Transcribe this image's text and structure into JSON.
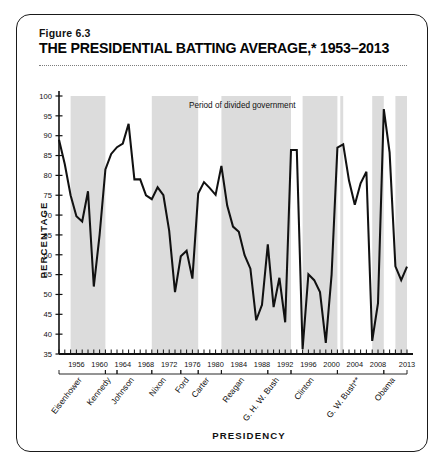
{
  "figure": {
    "label": "Figure 6.3",
    "title": "THE PRESIDENTIAL BATTING AVERAGE,* 1953–2013"
  },
  "legend": {
    "position": "top-center",
    "entries": [
      {
        "label": "Period of divided government",
        "swatch_color": "#dcdcdc"
      }
    ]
  },
  "colors": {
    "line": "#111111",
    "shade": "#dcdcdc",
    "axis": "#111111",
    "frame": "#1a1a1a",
    "background": "#ffffff"
  },
  "chart_data": {
    "type": "line",
    "title": "THE PRESIDENTIAL BATTING AVERAGE,* 1953–2013",
    "xlabel": "PRESIDENCY",
    "ylabel": "PERCENTAGE",
    "xlim": [
      1953,
      2013
    ],
    "ylim": [
      35,
      100
    ],
    "yticks": [
      35,
      40,
      45,
      50,
      55,
      60,
      65,
      70,
      75,
      80,
      85,
      90,
      95,
      100
    ],
    "xticks": [
      1956,
      1960,
      1964,
      1968,
      1972,
      1976,
      1980,
      1984,
      1988,
      1992,
      1996,
      2000,
      2004,
      2008,
      2013
    ],
    "xtick_interval_minor": 1,
    "grid": false,
    "legend_position": "top-center",
    "series": [
      {
        "name": "Presidential success rate on congressional votes",
        "x": [
          1953,
          1954,
          1955,
          1956,
          1957,
          1958,
          1959,
          1960,
          1961,
          1962,
          1963,
          1964,
          1965,
          1966,
          1967,
          1968,
          1969,
          1970,
          1971,
          1972,
          1973,
          1974,
          1975,
          1976,
          1977,
          1978,
          1979,
          1980,
          1981,
          1982,
          1983,
          1984,
          1985,
          1986,
          1987,
          1988,
          1989,
          1990,
          1991,
          1992,
          1993,
          1994,
          1995,
          1996,
          1997,
          1998,
          1999,
          2000,
          2001,
          2002,
          2003,
          2004,
          2005,
          2006,
          2007,
          2008,
          2009,
          2010,
          2011,
          2012,
          2013
        ],
        "values": [
          89.0,
          82.8,
          75.0,
          69.7,
          68.4,
          76.0,
          52.0,
          65.0,
          81.5,
          85.4,
          87.1,
          88.0,
          93.0,
          79.0,
          79.0,
          75.0,
          74.0,
          77.0,
          75.0,
          66.0,
          50.6,
          59.6,
          61.0,
          54.0,
          75.4,
          78.3,
          76.8,
          75.1,
          82.4,
          72.4,
          67.1,
          65.8,
          59.9,
          56.5,
          43.5,
          47.4,
          62.6,
          46.8,
          54.2,
          43.0,
          86.4,
          86.4,
          36.2,
          55.1,
          53.6,
          50.6,
          37.8,
          55.0,
          87.0,
          87.8,
          78.7,
          72.6,
          78.0,
          80.9,
          38.3,
          47.8,
          96.7,
          85.8,
          57.1,
          53.6,
          57.0
        ]
      }
    ],
    "shaded_regions": [
      {
        "label": "divided government",
        "start": 1955,
        "end": 1961
      },
      {
        "label": "divided government",
        "start": 1969,
        "end": 1977
      },
      {
        "label": "divided government",
        "start": 1981,
        "end": 1993
      },
      {
        "label": "divided government",
        "start": 1995,
        "end": 2001
      },
      {
        "label": "divided government",
        "start": 2001.5,
        "end": 2002
      },
      {
        "label": "divided government",
        "start": 2007,
        "end": 2009
      },
      {
        "label": "divided government",
        "start": 2011,
        "end": 2013
      }
    ],
    "presidents": [
      {
        "name": "Eisenhower",
        "start": 1953,
        "end": 1961
      },
      {
        "name": "Kennedy",
        "start": 1961,
        "end": 1963
      },
      {
        "name": "Johnson",
        "start": 1963,
        "end": 1969
      },
      {
        "name": "Nixon",
        "start": 1969,
        "end": 1974
      },
      {
        "name": "Ford",
        "start": 1974,
        "end": 1977
      },
      {
        "name": "Carter",
        "start": 1977,
        "end": 1981
      },
      {
        "name": "Reagan",
        "start": 1981,
        "end": 1989
      },
      {
        "name": "G. H. W. Bush",
        "start": 1989,
        "end": 1993
      },
      {
        "name": "Clinton",
        "start": 1993,
        "end": 2001
      },
      {
        "name": "G. W. Bush**",
        "start": 2001,
        "end": 2009
      },
      {
        "name": "Obama",
        "start": 2009,
        "end": 2013
      }
    ]
  }
}
